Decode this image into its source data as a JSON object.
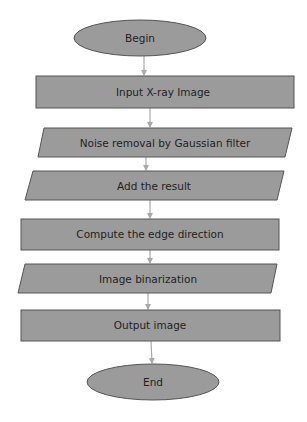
{
  "diagram": {
    "type": "flowchart",
    "colors": {
      "fill": "#9b9b9b",
      "stroke": "#555555",
      "arrow": "#a9a9a9",
      "text": "#1f1f1f",
      "background": "#ffffff"
    },
    "nodes": [
      {
        "id": "begin",
        "shape": "ellipse",
        "label": "Begin"
      },
      {
        "id": "input",
        "shape": "rectangle",
        "label": "Input X-ray Image"
      },
      {
        "id": "noise",
        "shape": "parallelogram",
        "label": "Noise removal by Gaussian filter"
      },
      {
        "id": "add",
        "shape": "parallelogram",
        "label": "Add the result"
      },
      {
        "id": "edge",
        "shape": "rectangle",
        "label": "Compute the edge direction"
      },
      {
        "id": "binarize",
        "shape": "parallelogram",
        "label": "Image binarization"
      },
      {
        "id": "output",
        "shape": "rectangle",
        "label": "Output image"
      },
      {
        "id": "end",
        "shape": "ellipse",
        "label": "End"
      }
    ],
    "edges": [
      {
        "from": "begin",
        "to": "input"
      },
      {
        "from": "input",
        "to": "noise"
      },
      {
        "from": "noise",
        "to": "add"
      },
      {
        "from": "add",
        "to": "edge"
      },
      {
        "from": "edge",
        "to": "binarize"
      },
      {
        "from": "binarize",
        "to": "output"
      },
      {
        "from": "output",
        "to": "end"
      }
    ]
  }
}
